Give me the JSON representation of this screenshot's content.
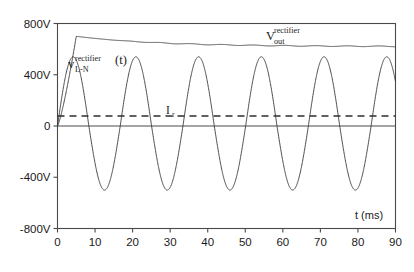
{
  "chart_data": {
    "type": "line",
    "title": "",
    "xlabel": "t (ms)",
    "ylabel": "",
    "xlim": [
      0,
      90
    ],
    "ylim": [
      -800,
      800
    ],
    "grid": false,
    "legend": "inline-annotations",
    "x_ticks": [
      0,
      10,
      20,
      30,
      40,
      50,
      60,
      70,
      80,
      90
    ],
    "x_tick_labels": [
      "0",
      "10",
      "20",
      "30",
      "40",
      "50",
      "60",
      "70",
      "80",
      "90"
    ],
    "y_ticks": [
      800,
      400,
      0,
      -400,
      -800
    ],
    "y_tick_labels": [
      "800V",
      "400V",
      "0",
      "-400V",
      "-800V"
    ],
    "annotations": [
      {
        "name": "v-rectifier-ln",
        "base": "v",
        "superscript": "rectifier",
        "subscript": "L-N",
        "suffix": "(t)",
        "x_ms": 11.0,
        "y_v": 470
      },
      {
        "name": "v-rectifier-out",
        "base": "V",
        "superscript": "rectifier",
        "subscript": "out",
        "suffix": "",
        "x_ms": 62.0,
        "y_v": 745
      },
      {
        "name": "ir-threshold",
        "base": "I",
        "superscript": "",
        "subscript": "r",
        "suffix": "",
        "x_ms": 33.0,
        "y_v": 190
      }
    ],
    "series": [
      {
        "name": "v_L-N^rectifier (t)",
        "type": "sine",
        "style": "solid",
        "color": "#3a3a3a",
        "amplitude_v": 540,
        "negative_peak_v": -500,
        "period_ms": 16.7,
        "frequency_hz": 60,
        "phase_deg": 0,
        "start_ms": 0,
        "end_ms": 90,
        "peaks_ms": [
          4.2,
          20.9,
          37.6,
          54.2,
          70.9,
          87.6
        ],
        "troughs_ms": [
          12.5,
          29.2,
          45.8,
          62.5,
          79.2
        ]
      },
      {
        "name": "V_out^rectifier",
        "type": "decaying-dc",
        "style": "solid",
        "color": "#3a3a3a",
        "initial_v": 0,
        "peak_v": 700,
        "peak_ms": 5.0,
        "settle_v": 620,
        "final_v": 618,
        "ripple_v": 6
      },
      {
        "name": "I_r",
        "type": "horizontal-threshold",
        "style": "dashed",
        "color": "#2e2e2e",
        "value_v": 78
      },
      {
        "name": "zero-axis",
        "type": "horizontal-reference",
        "style": "solid",
        "color": "#4a4a4a",
        "value_v": 0
      }
    ]
  },
  "figure": {
    "x_axis_title": "t (ms)",
    "background": "#ffffff",
    "axis_color": "#4a4a4a",
    "trace_color": "#3a3a3a",
    "dash_color": "#2e2e2e"
  }
}
